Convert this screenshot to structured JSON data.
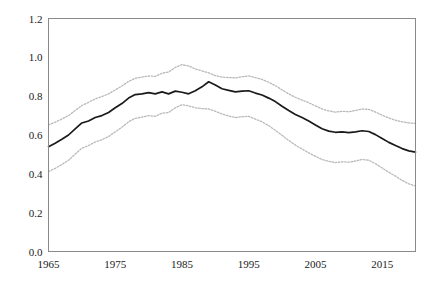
{
  "chart_data": {
    "type": "line",
    "title": "",
    "subtitle": "",
    "xlabel": "",
    "ylabel": "",
    "xlim": [
      1965,
      2020
    ],
    "ylim": [
      0.0,
      1.2
    ],
    "grid": false,
    "legend": null,
    "legend_position": "none",
    "x_ticks": [
      1965,
      1975,
      1985,
      1995,
      2005,
      2015
    ],
    "x_tick_labels": [
      "1965",
      "1975",
      "1985",
      "1995",
      "2005",
      "2015"
    ],
    "y_ticks": [
      0.0,
      0.2,
      0.4,
      0.6,
      0.8,
      1.0,
      1.2
    ],
    "y_tick_labels": [
      "0.0",
      "0.2",
      "0.4",
      "0.6",
      "0.8",
      "1.0",
      "1.2"
    ],
    "colors": {
      "estimate": "#1a1a1a",
      "confidence_band": "#b9b9b9",
      "frame": "#8a8a8a",
      "background": "#ffffff"
    },
    "x": [
      1965,
      1966,
      1967,
      1968,
      1969,
      1970,
      1971,
      1972,
      1973,
      1974,
      1975,
      1976,
      1977,
      1978,
      1979,
      1980,
      1981,
      1982,
      1983,
      1984,
      1985,
      1986,
      1987,
      1988,
      1989,
      1990,
      1991,
      1992,
      1993,
      1994,
      1995,
      1996,
      1997,
      1998,
      1999,
      2000,
      2001,
      2002,
      2003,
      2004,
      2005,
      2006,
      2007,
      2008,
      2009,
      2010,
      2011,
      2012,
      2013,
      2014,
      2015,
      2016,
      2017,
      2018,
      2019,
      2020
    ],
    "series": [
      {
        "name": "estimate",
        "style": "solid",
        "values": [
          0.54,
          0.558,
          0.578,
          0.6,
          0.632,
          0.662,
          0.672,
          0.69,
          0.7,
          0.716,
          0.74,
          0.762,
          0.79,
          0.808,
          0.812,
          0.818,
          0.812,
          0.822,
          0.812,
          0.826,
          0.82,
          0.812,
          0.828,
          0.848,
          0.874,
          0.858,
          0.838,
          0.83,
          0.822,
          0.826,
          0.828,
          0.816,
          0.806,
          0.79,
          0.772,
          0.748,
          0.726,
          0.706,
          0.69,
          0.672,
          0.652,
          0.632,
          0.62,
          0.614,
          0.616,
          0.612,
          0.616,
          0.622,
          0.618,
          0.602,
          0.582,
          0.562,
          0.546,
          0.53,
          0.518,
          0.512
        ]
      },
      {
        "name": "upper-confidence-bound",
        "style": "dotted",
        "values": [
          0.652,
          0.666,
          0.682,
          0.7,
          0.726,
          0.752,
          0.768,
          0.786,
          0.798,
          0.812,
          0.832,
          0.852,
          0.876,
          0.892,
          0.898,
          0.904,
          0.902,
          0.918,
          0.924,
          0.948,
          0.962,
          0.956,
          0.94,
          0.93,
          0.92,
          0.906,
          0.898,
          0.896,
          0.894,
          0.9,
          0.904,
          0.896,
          0.886,
          0.872,
          0.854,
          0.832,
          0.812,
          0.794,
          0.78,
          0.766,
          0.75,
          0.734,
          0.724,
          0.718,
          0.722,
          0.72,
          0.726,
          0.734,
          0.732,
          0.718,
          0.702,
          0.688,
          0.676,
          0.668,
          0.662,
          0.66
        ]
      },
      {
        "name": "lower-confidence-bound",
        "style": "dotted",
        "values": [
          0.412,
          0.428,
          0.448,
          0.47,
          0.502,
          0.532,
          0.546,
          0.564,
          0.576,
          0.592,
          0.616,
          0.64,
          0.668,
          0.686,
          0.692,
          0.7,
          0.696,
          0.712,
          0.716,
          0.74,
          0.756,
          0.75,
          0.74,
          0.736,
          0.734,
          0.722,
          0.708,
          0.698,
          0.69,
          0.694,
          0.696,
          0.682,
          0.668,
          0.648,
          0.624,
          0.598,
          0.572,
          0.548,
          0.528,
          0.508,
          0.49,
          0.474,
          0.464,
          0.458,
          0.462,
          0.46,
          0.466,
          0.474,
          0.47,
          0.452,
          0.43,
          0.408,
          0.388,
          0.366,
          0.348,
          0.338
        ]
      }
    ]
  }
}
